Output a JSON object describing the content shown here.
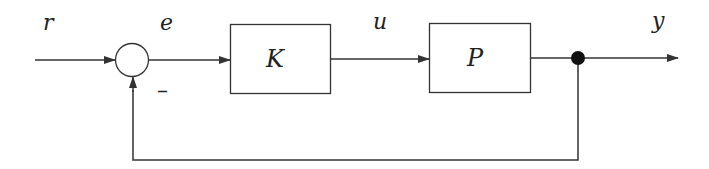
{
  "diagram": {
    "type": "feedback-control-block-diagram",
    "signals": {
      "reference": "r",
      "error": "e",
      "control": "u",
      "output": "y"
    },
    "blocks": {
      "controller": "K",
      "plant": "P"
    },
    "summing_junction": {
      "feedback_sign": "–"
    },
    "colors": {
      "line": "#333333",
      "background": "#ffffff"
    }
  }
}
